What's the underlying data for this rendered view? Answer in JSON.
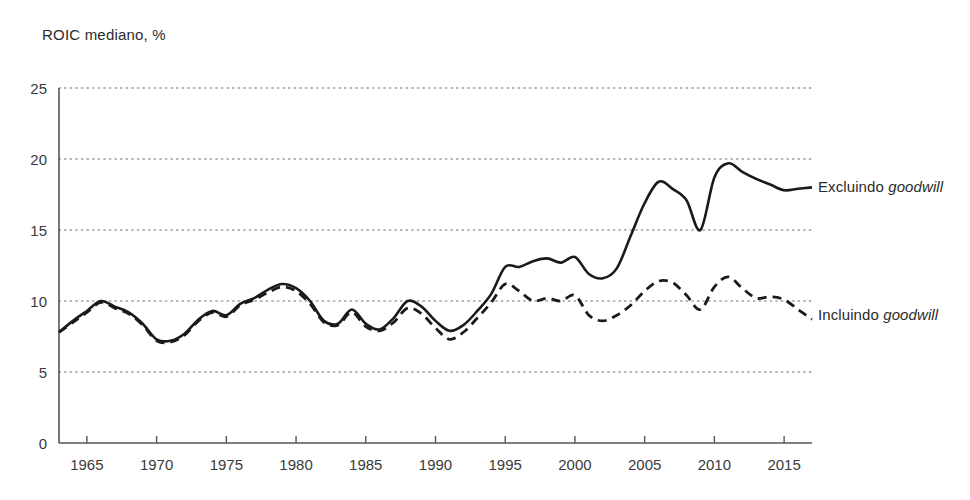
{
  "chart_data": {
    "type": "line",
    "title": "ROIC mediano, %",
    "xlabel": "",
    "ylabel": "",
    "ylim": [
      0,
      25
    ],
    "xlim": [
      1963,
      2017
    ],
    "yticks": [
      0,
      5,
      10,
      15,
      20,
      25
    ],
    "xticks": [
      1965,
      1970,
      1975,
      1980,
      1985,
      1990,
      1995,
      2000,
      2005,
      2010,
      2015
    ],
    "grid": "horizontal-dotted",
    "legend_position": "right-inline",
    "x": [
      1963,
      1964,
      1965,
      1966,
      1967,
      1968,
      1969,
      1970,
      1971,
      1972,
      1973,
      1974,
      1975,
      1976,
      1977,
      1978,
      1979,
      1980,
      1981,
      1982,
      1983,
      1984,
      1985,
      1986,
      1987,
      1988,
      1989,
      1990,
      1991,
      1992,
      1993,
      1994,
      1995,
      1996,
      1997,
      1998,
      1999,
      2000,
      2001,
      2002,
      2003,
      2004,
      2005,
      2006,
      2007,
      2008,
      2009,
      2010,
      2011,
      2012,
      2013,
      2014,
      2015,
      2016,
      2017
    ],
    "series": [
      {
        "name": "Excluindo goodwill",
        "style": "solid",
        "color": "#1a1a1a",
        "label_plain": "Excluindo ",
        "label_italic": "goodwill",
        "values": [
          7.8,
          8.6,
          9.3,
          10.0,
          9.6,
          9.2,
          8.4,
          7.3,
          7.2,
          7.7,
          8.7,
          9.3,
          9.0,
          9.8,
          10.2,
          10.8,
          11.2,
          10.9,
          10.0,
          8.6,
          8.4,
          9.4,
          8.4,
          8.0,
          8.8,
          10.0,
          9.6,
          8.6,
          7.9,
          8.3,
          9.3,
          10.5,
          12.4,
          12.4,
          12.8,
          13.0,
          12.7,
          13.1,
          11.9,
          11.6,
          12.3,
          14.6,
          16.9,
          18.4,
          17.9,
          17.1,
          15.0,
          18.7,
          19.7,
          19.1,
          18.6,
          18.2,
          17.8,
          17.9,
          18.0
        ]
      },
      {
        "name": "Incluindo goodwill",
        "style": "dashed",
        "color": "#1a1a1a",
        "label_plain": "Incluindo ",
        "label_italic": "goodwill",
        "values": [
          7.8,
          8.5,
          9.2,
          9.9,
          9.5,
          9.1,
          8.3,
          7.2,
          7.1,
          7.6,
          8.6,
          9.2,
          8.9,
          9.7,
          10.1,
          10.6,
          11.0,
          10.7,
          9.8,
          8.5,
          8.3,
          9.2,
          8.2,
          7.9,
          8.5,
          9.5,
          9.1,
          8.1,
          7.3,
          7.8,
          8.8,
          9.9,
          11.2,
          10.7,
          10.0,
          10.2,
          10.0,
          10.4,
          9.0,
          8.6,
          9.0,
          9.7,
          10.7,
          11.4,
          11.3,
          10.4,
          9.4,
          11.0,
          11.7,
          10.9,
          10.2,
          10.3,
          10.1,
          9.4,
          8.7
        ]
      }
    ]
  },
  "axis": {
    "y_labels": [
      "0",
      "5",
      "10",
      "15",
      "20",
      "25"
    ],
    "x_labels": [
      "1965",
      "1970",
      "1975",
      "1980",
      "1985",
      "1990",
      "1995",
      "2000",
      "2005",
      "2010",
      "2015"
    ]
  },
  "colors": {
    "line": "#1a1a1a",
    "axis": "#555555",
    "grid": "#9a9a9a",
    "text": "#2b2b2b",
    "background": "#ffffff"
  }
}
